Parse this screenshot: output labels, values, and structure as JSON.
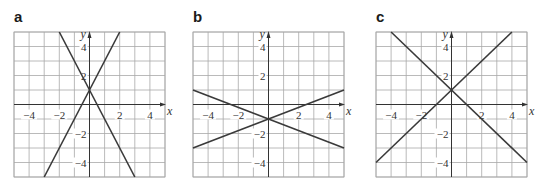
{
  "chart_data": [
    {
      "type": "line",
      "panel": "a",
      "title": "a",
      "xlabel": "x",
      "ylabel": "y",
      "xlim": [
        -5,
        5
      ],
      "ylim": [
        -5,
        5
      ],
      "x_ticks": [
        -4,
        -2,
        2,
        4
      ],
      "y_ticks": [
        4,
        2,
        -2,
        -4
      ],
      "grid": true,
      "series": [
        {
          "name": "line 1",
          "equation": "y = 2x + 1",
          "points": [
            [
              -3,
              -5
            ],
            [
              2,
              5
            ]
          ]
        },
        {
          "name": "line 2",
          "equation": "y = -2x + 1",
          "points": [
            [
              -2,
              5
            ],
            [
              3,
              -5
            ]
          ]
        }
      ],
      "intersection": [
        0,
        1
      ]
    },
    {
      "type": "line",
      "panel": "b",
      "title": "b",
      "xlabel": "x",
      "ylabel": "y",
      "xlim": [
        -5,
        5
      ],
      "ylim": [
        -5,
        5
      ],
      "x_ticks": [
        -4,
        -2,
        2,
        4
      ],
      "y_ticks": [
        4,
        2,
        -2,
        -4
      ],
      "grid": true,
      "series": [
        {
          "name": "line 1",
          "equation": "y = 0.4x - 1",
          "points": [
            [
              -5,
              -3
            ],
            [
              5,
              1
            ]
          ]
        },
        {
          "name": "line 2",
          "equation": "y = -0.4x - 1",
          "points": [
            [
              -5,
              1
            ],
            [
              5,
              -3
            ]
          ]
        }
      ],
      "intersection": [
        0,
        -1
      ]
    },
    {
      "type": "line",
      "panel": "c",
      "title": "c",
      "xlabel": "x",
      "ylabel": "y",
      "xlim": [
        -5,
        5
      ],
      "ylim": [
        -5,
        5
      ],
      "x_ticks": [
        -4,
        -2,
        2,
        4
      ],
      "y_ticks": [
        4,
        2,
        -2,
        -4
      ],
      "grid": true,
      "series": [
        {
          "name": "line 1",
          "equation": "y = x + 1",
          "points": [
            [
              -5,
              -4
            ],
            [
              4,
              5
            ]
          ]
        },
        {
          "name": "line 2",
          "equation": "y = -x + 1",
          "points": [
            [
              -4,
              5
            ],
            [
              5,
              -4
            ]
          ]
        }
      ],
      "intersection": [
        0,
        1
      ]
    }
  ],
  "panels": [
    {
      "label": "a",
      "left": 14
    },
    {
      "label": "b",
      "left": 193
    },
    {
      "label": "c",
      "left": 376
    }
  ],
  "style": {
    "line_color": "#3a3a3a",
    "grid_color": "#a8a8a8",
    "axis_color": "#333333"
  }
}
